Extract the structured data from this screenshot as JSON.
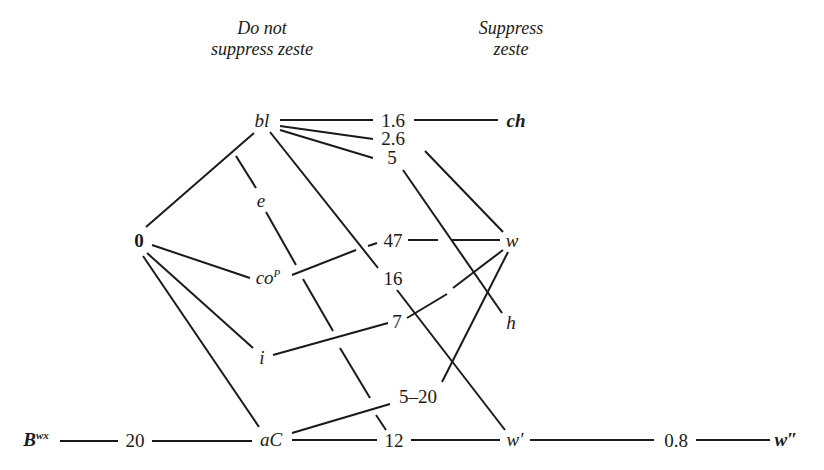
{
  "headers": {
    "left": {
      "line1": "Do not",
      "line2": "suppress zeste"
    },
    "right": {
      "line1": "Suppress",
      "line2": "zeste"
    }
  },
  "nodes": {
    "bl": {
      "label": "bl",
      "x": 262,
      "y": 120
    },
    "ch": {
      "label": "ch",
      "x": 516,
      "y": 120
    },
    "n1_6": {
      "label": "1.6",
      "x": 392,
      "y": 120
    },
    "n2_6": {
      "label": "2.6",
      "x": 392,
      "y": 138
    },
    "n5a": {
      "label": "5",
      "x": 392,
      "y": 157
    },
    "e": {
      "label": "e",
      "x": 261,
      "y": 200
    },
    "zero": {
      "label": "0",
      "x": 139,
      "y": 240
    },
    "n47": {
      "label": "47",
      "x": 392,
      "y": 240
    },
    "w": {
      "label": "w",
      "x": 512,
      "y": 240
    },
    "co": {
      "label": "co",
      "sup": "P",
      "x": 268,
      "y": 277
    },
    "n16": {
      "label": "16",
      "x": 392,
      "y": 278
    },
    "n7": {
      "label": "7",
      "x": 397,
      "y": 321
    },
    "h": {
      "label": "h",
      "x": 511,
      "y": 322
    },
    "i": {
      "label": "i",
      "x": 262,
      "y": 357
    },
    "n5_20": {
      "label": "5–20",
      "x": 418,
      "y": 396
    },
    "Bwx": {
      "label": "B",
      "sup": "wx",
      "x": 35,
      "y": 439
    },
    "n20": {
      "label": "20",
      "x": 135,
      "y": 439
    },
    "aC": {
      "label": "aC",
      "x": 268,
      "y": 439
    },
    "n12": {
      "label": "12",
      "x": 392,
      "y": 439
    },
    "wp": {
      "label": "w′",
      "x": 512,
      "y": 439
    },
    "n0_8": {
      "label": "0.8",
      "x": 678,
      "y": 439
    },
    "wpp": {
      "label": "w″",
      "x": 785,
      "y": 439
    }
  },
  "edges": [
    [
      "bl",
      "n1_6"
    ],
    [
      "n1_6",
      "ch"
    ],
    [
      "bl",
      "n2_6"
    ],
    [
      "bl",
      "n5a"
    ],
    [
      "bl",
      "zero"
    ],
    [
      "bl",
      "n16"
    ],
    [
      "n2_6",
      "w"
    ],
    [
      "n5a",
      "h"
    ],
    [
      "zero",
      "co"
    ],
    [
      "zero",
      "i"
    ],
    [
      "zero",
      "aC"
    ],
    [
      "co",
      "n47"
    ],
    [
      "n47",
      "w"
    ],
    [
      "n16",
      "wp"
    ],
    [
      "i",
      "n7"
    ],
    [
      "n7",
      "w"
    ],
    [
      "w",
      "n5_20"
    ],
    [
      "aC",
      "n5_20"
    ],
    [
      "e",
      "n12"
    ],
    [
      "Bwx",
      "n20"
    ],
    [
      "n20",
      "aC"
    ],
    [
      "aC",
      "n12"
    ],
    [
      "n12",
      "wp"
    ],
    [
      "wp",
      "n0_8"
    ],
    [
      "n0_8",
      "wpp"
    ]
  ],
  "colors": {
    "line": "#1a1a1a",
    "background": "#ffffff"
  }
}
